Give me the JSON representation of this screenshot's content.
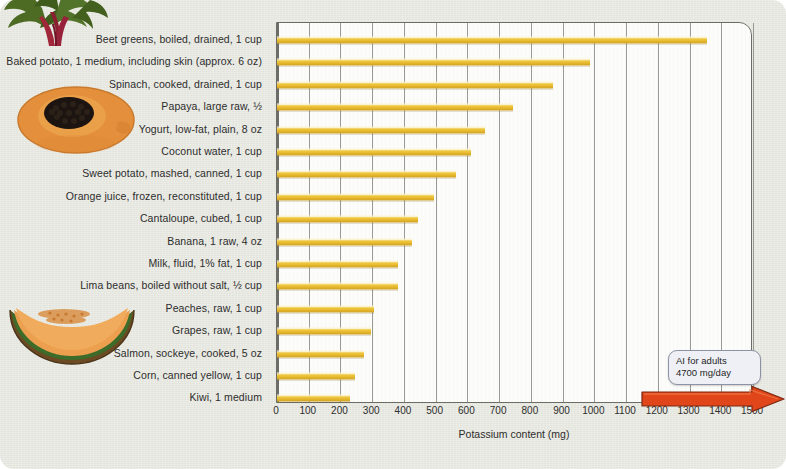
{
  "figure": {
    "background_color": "#e8e9e1",
    "bar_color": "#e8b830",
    "arrow_color": "#e0461a"
  },
  "callout": {
    "line1": "AI for adults",
    "line2": "4700 mg/day"
  },
  "decorative_images": [
    {
      "name": "beet-greens-image",
      "alt": "beet greens"
    },
    {
      "name": "papaya-image",
      "alt": "papaya half"
    },
    {
      "name": "cantaloupe-image",
      "alt": "cantaloupe slice"
    }
  ],
  "chart_data": {
    "type": "bar",
    "orientation": "horizontal",
    "title": "",
    "xlabel": "Potassium content (mg)",
    "ylabel": "",
    "xlim": [
      0,
      1500
    ],
    "xticks": [
      0,
      100,
      200,
      300,
      400,
      500,
      600,
      700,
      800,
      900,
      1000,
      1100,
      1200,
      1300,
      1400,
      1500
    ],
    "grid": true,
    "legend": "none",
    "categories": [
      "Beet greens, boiled, drained, 1 cup",
      "Baked potato, 1 medium, including skin (approx. 6 oz)",
      "Spinach, cooked, drained, 1 cup",
      "Papaya, large raw, ½",
      "Yogurt, low-fat, plain, 8 oz",
      "Coconut water, 1 cup",
      "Sweet potato, mashed, canned, 1 cup",
      "Orange juice, frozen, reconstituted, 1 cup",
      "Cantaloupe, cubed, 1 cup",
      "Banana, 1 raw, 4 oz",
      "Milk, fluid, 1% fat, 1 cup",
      "Lima beans, boiled without salt, ½ cup",
      "Peaches, raw, 1 cup",
      "Grapes, raw, 1 cup",
      "Salmon, sockeye, cooked, 5 oz",
      "Corn, canned yellow, 1 cup",
      "Kiwi, 1 medium"
    ],
    "values": [
      1355,
      985,
      870,
      745,
      655,
      610,
      565,
      495,
      445,
      425,
      380,
      380,
      305,
      295,
      275,
      245,
      230
    ],
    "annotations": [
      {
        "text": "AI for adults 4700 mg/day",
        "note": "callout with red arrow pointing right past 1500 mg"
      }
    ]
  }
}
